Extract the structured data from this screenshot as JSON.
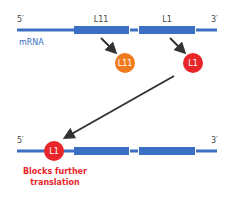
{
  "top_strand": {
    "five_prime": "5′",
    "three_prime": "3′",
    "molecule_label": "mRNA",
    "genes": [
      {
        "label": "L11"
      },
      {
        "label": "L1"
      }
    ]
  },
  "proteins": [
    {
      "label": "L11",
      "color": "#f07a1e"
    },
    {
      "label": "L1",
      "color": "#e8262a"
    }
  ],
  "bottom_strand": {
    "five_prime": "5′",
    "three_prime": "3′",
    "bound_protein": "L1",
    "caption_line1": "Blocks further",
    "caption_line2": "translation"
  },
  "colors": {
    "mrna": "#3a6fc4",
    "arrow": "#333333",
    "caption": "#e8262a",
    "text": "#444444"
  }
}
